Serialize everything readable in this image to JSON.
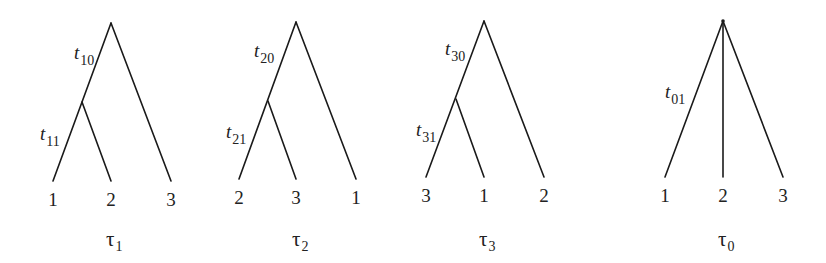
{
  "diagram": {
    "trees": [
      {
        "name": "τ",
        "subscript": "1",
        "branch_labels": [
          {
            "var": "t",
            "sub": "10",
            "x": 74,
            "y": 59
          },
          {
            "var": "t",
            "sub": "11",
            "x": 40,
            "y": 140
          }
        ],
        "root": [
          111,
          23
        ],
        "internal": [
          82,
          102
        ],
        "leaves": [
          {
            "label": "1",
            "x": 53,
            "y": 181
          },
          {
            "label": "2",
            "x": 111,
            "y": 181
          },
          {
            "label": "3",
            "x": 171,
            "y": 181
          }
        ],
        "title_x": 106
      },
      {
        "name": "τ",
        "subscript": "2",
        "branch_labels": [
          {
            "var": "t",
            "sub": "20",
            "x": 254,
            "y": 57
          },
          {
            "var": "t",
            "sub": "21",
            "x": 226,
            "y": 138
          }
        ],
        "root": [
          296,
          22
        ],
        "internal": [
          268,
          101
        ],
        "leaves": [
          {
            "label": "2",
            "x": 239,
            "y": 179
          },
          {
            "label": "3",
            "x": 296,
            "y": 179
          },
          {
            "label": "1",
            "x": 356,
            "y": 179
          }
        ],
        "title_x": 292
      },
      {
        "name": "τ",
        "subscript": "3",
        "branch_labels": [
          {
            "var": "t",
            "sub": "30",
            "x": 445,
            "y": 55
          },
          {
            "var": "t",
            "sub": "31",
            "x": 416,
            "y": 136
          }
        ],
        "root": [
          484,
          21
        ],
        "internal": [
          456,
          99
        ],
        "leaves": [
          {
            "label": "3",
            "x": 426,
            "y": 177
          },
          {
            "label": "1",
            "x": 484,
            "y": 177
          },
          {
            "label": "2",
            "x": 544,
            "y": 177
          }
        ],
        "title_x": 479
      },
      {
        "name": "τ",
        "subscript": "0",
        "branch_labels": [
          {
            "var": "t",
            "sub": "01",
            "x": 665,
            "y": 98
          }
        ],
        "root": [
          723,
          21
        ],
        "internal": null,
        "leaves": [
          {
            "label": "1",
            "x": 665,
            "y": 177
          },
          {
            "label": "2",
            "x": 723,
            "y": 177
          },
          {
            "label": "3",
            "x": 783,
            "y": 177
          }
        ],
        "title_x": 718
      }
    ]
  }
}
